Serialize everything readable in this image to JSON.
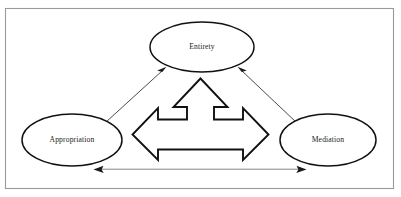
{
  "figure": {
    "type": "concept-diagram",
    "title": "",
    "background_color": "#ffffff",
    "border_color": "#9a9a9a",
    "shape_outline_color": "#111111",
    "text_color": "#1a1a1a"
  },
  "nodes": [
    {
      "id": "entirety",
      "label": "Entirety",
      "shape": "ellipse",
      "position": "top-center",
      "cx": 202,
      "cy": 47,
      "rx": 52,
      "ry": 25
    },
    {
      "id": "appropriation",
      "label": "Appropriation",
      "shape": "ellipse",
      "position": "bottom-left",
      "cx": 72,
      "cy": 140,
      "rx": 50,
      "ry": 26
    },
    {
      "id": "mediation",
      "label": "Mediation",
      "shape": "ellipse",
      "position": "bottom-right",
      "cx": 328,
      "cy": 140,
      "rx": 48,
      "ry": 26
    }
  ],
  "connectors": [
    {
      "id": "appropriation-entirety",
      "from": "appropriation",
      "to": "entirety",
      "style": "double-headed-arrow",
      "orientation": "diagonal-left"
    },
    {
      "id": "entirety-mediation",
      "from": "entirety",
      "to": "mediation",
      "style": "double-headed-arrow",
      "orientation": "diagonal-right"
    },
    {
      "id": "appropriation-mediation",
      "from": "appropriation",
      "to": "mediation",
      "style": "double-headed-arrow",
      "orientation": "horizontal-bottom"
    }
  ],
  "center_shape": {
    "id": "tri-directional-arrow",
    "name": "three-way-arrow",
    "directions": [
      "up",
      "left",
      "right"
    ],
    "fill": "#ffffff",
    "outline": "#111111"
  }
}
